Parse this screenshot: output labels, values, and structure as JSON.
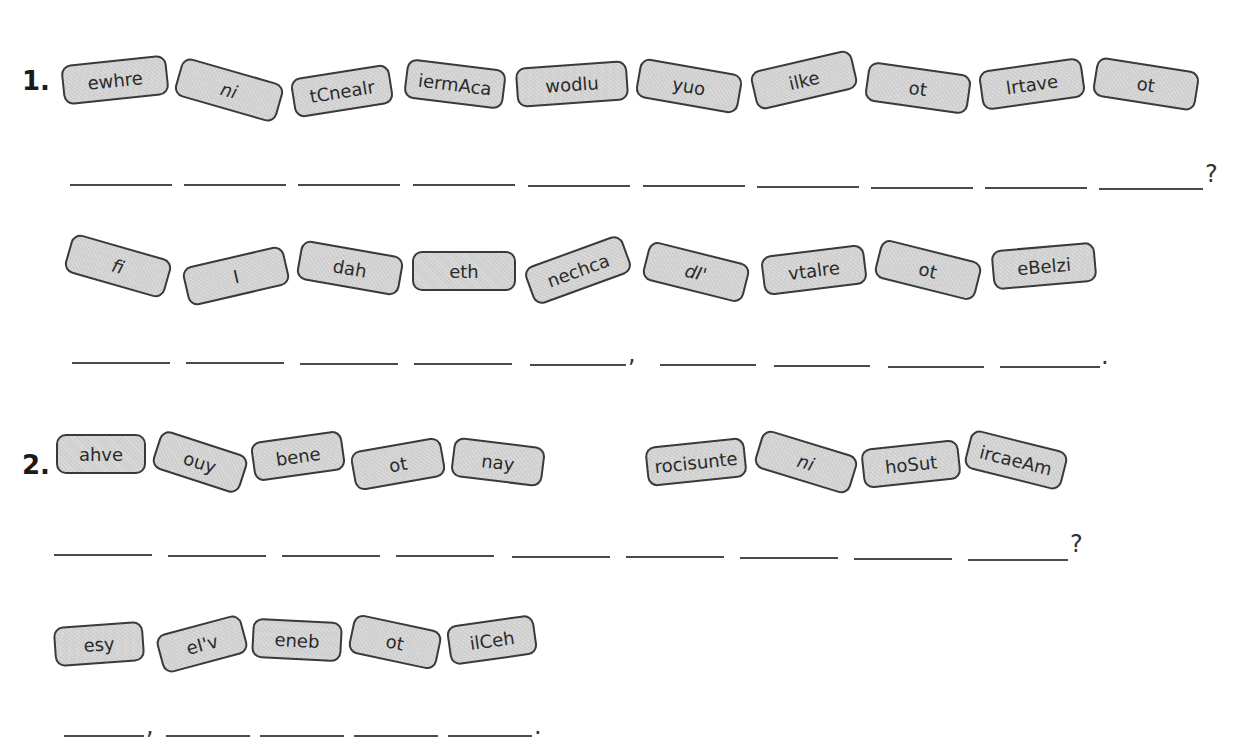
{
  "exercise": [
    {
      "number": "1.",
      "parts": [
        {
          "tiles": [
            "ewhre",
            "ni",
            "tCnealr",
            "iermAca",
            "wodlu",
            "yuo",
            "ilke",
            "ot",
            "lrtave",
            "ot"
          ],
          "blank_count": 10,
          "punctuation": [
            {
              "after_blank": 10,
              "mark": "?"
            }
          ]
        },
        {
          "tiles": [
            "fi",
            "I",
            "dah",
            "eth",
            "nechca",
            "dI'",
            "vtalre",
            "ot",
            "eBelzi"
          ],
          "blank_count": 9,
          "punctuation": [
            {
              "after_blank": 5,
              "mark": ","
            },
            {
              "after_blank": 9,
              "mark": "."
            }
          ]
        }
      ]
    },
    {
      "number": "2.",
      "parts": [
        {
          "tiles": [
            "ahve",
            "ouy",
            "bene",
            "ot",
            "nay",
            "rocisunte",
            "ni",
            "hoSut",
            "ircaeAm"
          ],
          "blank_count": 9,
          "punctuation": [
            {
              "after_blank": 9,
              "mark": "?"
            }
          ]
        },
        {
          "tiles": [
            "esy",
            "eI'v",
            "eneb",
            "ot",
            "ilCeh"
          ],
          "blank_count": 5,
          "punctuation": [
            {
              "after_blank": 1,
              "mark": ","
            },
            {
              "after_blank": 5,
              "mark": "."
            }
          ]
        }
      ]
    }
  ],
  "colors": {
    "tile_fill": "#cfcfcf",
    "tile_border": "#3a3a3a",
    "line": "#4a4a4a"
  }
}
